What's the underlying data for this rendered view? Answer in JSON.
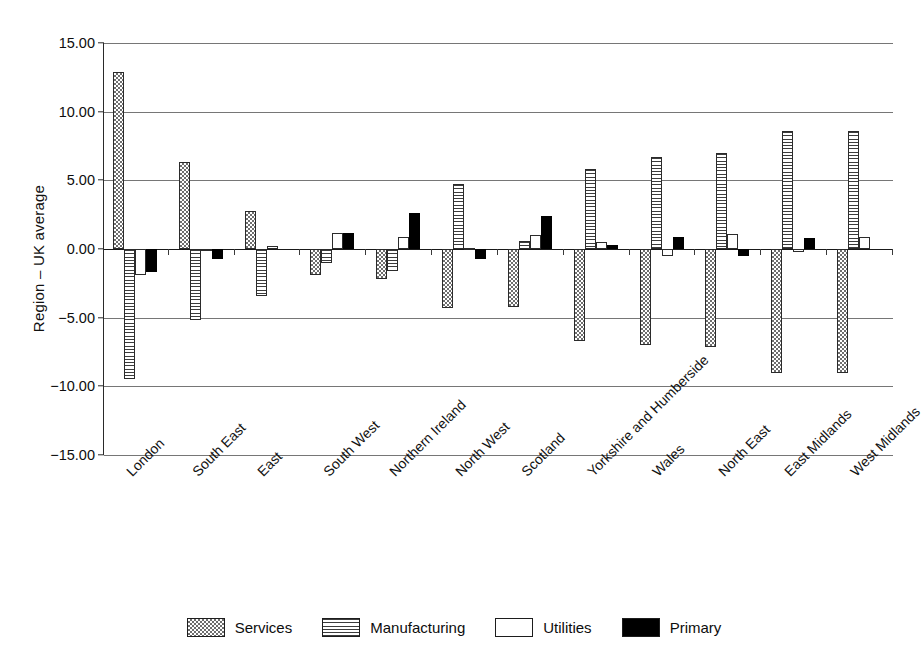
{
  "chart_data": {
    "type": "bar",
    "title": "",
    "subtitle": "",
    "xlabel": "",
    "ylabel": "Region – UK average",
    "ylim": [
      -15,
      15
    ],
    "ytick_step": 5,
    "ytick_labels": [
      "15.00",
      "10.00",
      "5.00",
      "0.00",
      "−5.00",
      "−10.00",
      "−15.00"
    ],
    "ytick_values": [
      15,
      10,
      5,
      0,
      -5,
      -10,
      -15
    ],
    "grid": true,
    "legend_position": "bottom",
    "categories": [
      "London",
      "South East",
      "East",
      "South West",
      "Northern Ireland",
      "North West",
      "Scotland",
      "Yorkshire and Humberside",
      "Wales",
      "North East",
      "East Midlands",
      "West Midlands"
    ],
    "series": [
      {
        "name": "Services",
        "pattern": "checkered",
        "color": "#6e6e6e",
        "values": [
          12.9,
          6.3,
          2.8,
          -1.9,
          -2.2,
          -4.3,
          -4.2,
          -6.7,
          -7.0,
          -7.1,
          -9.0,
          -9.0
        ]
      },
      {
        "name": "Manufacturing",
        "pattern": "horizontal-stripes",
        "color": "#3c3c3c",
        "values": [
          -9.5,
          -5.2,
          -3.4,
          -1.0,
          -1.6,
          4.7,
          0.6,
          5.8,
          6.7,
          7.0,
          8.6,
          8.6
        ]
      },
      {
        "name": "Utilities",
        "pattern": "solid-white",
        "color": "#ffffff",
        "values": [
          -1.9,
          -0.1,
          0.2,
          1.2,
          0.9,
          0.1,
          1.0,
          0.5,
          -0.5,
          1.1,
          -0.2,
          0.9
        ]
      },
      {
        "name": "Primary",
        "pattern": "solid-black",
        "color": "#000000",
        "values": [
          -1.7,
          -0.7,
          0.0,
          1.2,
          2.6,
          -0.7,
          2.4,
          0.3,
          0.9,
          -0.5,
          0.8,
          0.0
        ]
      }
    ]
  },
  "legend": {
    "items": [
      {
        "label": "Services"
      },
      {
        "label": "Manufacturing"
      },
      {
        "label": "Utilities"
      },
      {
        "label": "Primary"
      }
    ]
  }
}
